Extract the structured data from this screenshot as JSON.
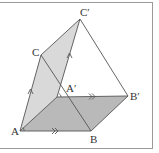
{
  "diagram": {
    "type": "prism-translation",
    "points": {
      "A": {
        "label": "A",
        "x": 20,
        "y": 131
      },
      "B": {
        "label": "B",
        "x": 91,
        "y": 131
      },
      "C": {
        "label": "C",
        "x": 41,
        "y": 55
      },
      "A'": {
        "label": "A′",
        "x": 57,
        "y": 97
      },
      "B'": {
        "label": "B′",
        "x": 128,
        "y": 96
      },
      "C'": {
        "label": "C′",
        "x": 80,
        "y": 19
      }
    },
    "faces": [
      {
        "name": "ACC'A'",
        "fill": "#d9d9d9"
      },
      {
        "name": "ABB'A'",
        "fill": "#b9b9b9"
      }
    ],
    "edges": [
      "AB",
      "BB'",
      "A'B'",
      "AA'",
      "AC",
      "CC'",
      "A'C'",
      "CB",
      "C'B'"
    ],
    "markers": {
      "single_arrow": [
        "AC",
        "A'C'"
      ],
      "double_arrow": [
        "AB",
        "A'B'"
      ]
    },
    "colors": {
      "line": "#555555",
      "light_face": "#d9d9d9",
      "dark_face": "#b9b9b9",
      "frame": "#9a9a9a"
    }
  }
}
